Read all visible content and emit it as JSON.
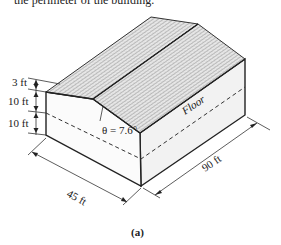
{
  "header_text": "the perimeter of the building.",
  "diagram": {
    "roof_height_label": "3 ft",
    "upper_wall_label": "10 ft",
    "lower_wall_label": "10 ft",
    "angle_label": "θ = 7.6°",
    "floor_label": "Floor",
    "width_label": "45 ft",
    "length_label": "90 ft",
    "figure_label": "(a)"
  },
  "colors": {
    "line": "#222222",
    "wall_front": "#ffffff",
    "wall_side": "#f2f2f2",
    "roof_fill": "#e4e4e4"
  }
}
